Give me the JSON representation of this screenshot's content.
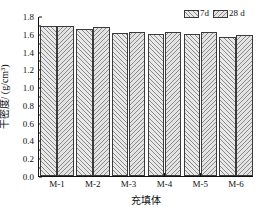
{
  "chart_data": {
    "type": "bar",
    "title": "",
    "xlabel": "充填体",
    "ylabel": "干密度/ (g/cm³)",
    "categories": [
      "M-1",
      "M-2",
      "M-3",
      "M-4",
      "M-5",
      "M-6"
    ],
    "series": [
      {
        "name": "7d",
        "values": [
          1.69,
          1.65,
          1.61,
          1.595,
          1.6,
          1.565
        ]
      },
      {
        "name": "28 d",
        "values": [
          1.69,
          1.675,
          1.625,
          1.615,
          1.615,
          1.585
        ]
      }
    ],
    "ylim": [
      0.0,
      1.8
    ],
    "ytick_step": 0.2,
    "yticks": [
      "0.0",
      "0.2",
      "0.4",
      "0.6",
      "0.8",
      "1.0",
      "1.2",
      "1.4",
      "1.6",
      "1.8"
    ],
    "grid": false,
    "legend_position": "top-right",
    "legend": [
      {
        "label": "7d",
        "hatch": "left-diagonal",
        "color": "#e8e8e8"
      },
      {
        "label": "28 d",
        "hatch": "right-diagonal",
        "color": "#e3e3e3"
      }
    ],
    "axis_color": "#111111",
    "bar_edge_color": "#3a3a3a"
  }
}
